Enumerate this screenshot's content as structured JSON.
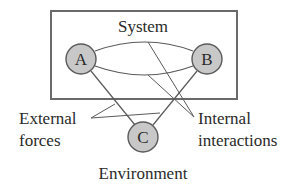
{
  "diagram": {
    "system_label": "System",
    "environment_label": "Environment",
    "nodes": [
      {
        "id": "A",
        "label": "A"
      },
      {
        "id": "B",
        "label": "B"
      },
      {
        "id": "C",
        "label": "C"
      }
    ],
    "annotations": {
      "external_line1": "External",
      "external_line2": "forces",
      "internal_line1": "Internal",
      "internal_line2": "interactions"
    },
    "colors": {
      "node_fill": "#c8c8c8",
      "stroke": "#5a5a5a",
      "box_stroke": "#6a6a6a",
      "text": "#2a2a2a"
    }
  }
}
